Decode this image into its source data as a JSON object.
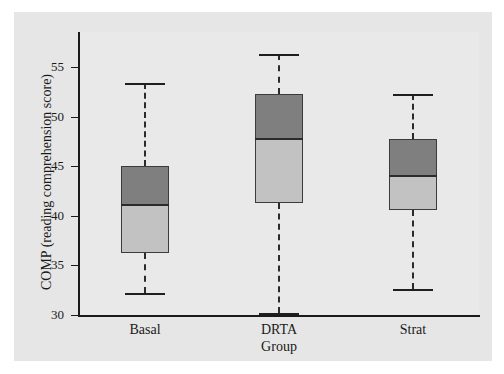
{
  "chart_data": {
    "type": "box",
    "title": "",
    "xlabel": "Group",
    "ylabel": "COMP (reading comprehension score)",
    "categories": [
      "Basal",
      "DRTA",
      "Strat"
    ],
    "ylim": [
      29,
      57.5
    ],
    "yticks": [
      30,
      35,
      40,
      45,
      50,
      55
    ],
    "ytick_labels": [
      "30",
      "35",
      "40",
      "45",
      "50",
      "55"
    ],
    "grid": false,
    "legend": null,
    "box_colors": {
      "upper_half": "#7f7f7f",
      "lower_half": "#c2c2c2",
      "outline": "#3b3b3b",
      "whisker": "#2b2b2b"
    },
    "background": "#e6e6e6",
    "boxes": [
      {
        "category": "Basal",
        "whisker_low": 32.2,
        "q1": 36.2,
        "median": 41.1,
        "q3": 45.0,
        "whisker_high": 53.4
      },
      {
        "category": "DRTA",
        "whisker_low": 30.2,
        "q1": 41.3,
        "median": 47.7,
        "q3": 52.3,
        "whisker_high": 56.3
      },
      {
        "category": "Strat",
        "whisker_low": 32.6,
        "q1": 40.6,
        "median": 44.0,
        "q3": 47.7,
        "whisker_high": 52.3
      }
    ]
  }
}
